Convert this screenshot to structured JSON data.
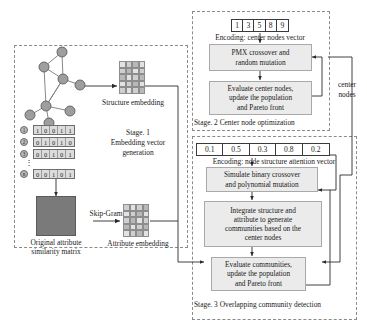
{
  "stage1": {
    "caption": "Stage. 1",
    "caption_line2": "Embedding vector",
    "caption_line3": "generation",
    "structure_embedding_label": "Structure embedding",
    "attribute_embedding_label": "Attribute embedding",
    "similarity_matrix_label_line1": "Original attribute",
    "similarity_matrix_label_line2": "similarity matrix",
    "skipgram_label": "Skip-Gram",
    "attribute_rows": [
      {
        "id": "1",
        "bits": [
          "1",
          "0",
          "0",
          "1",
          "1"
        ]
      },
      {
        "id": "2",
        "bits": [
          "0",
          "1",
          "0",
          "1",
          "0"
        ]
      },
      {
        "id": "3",
        "bits": [
          "0",
          "0",
          "1",
          "0",
          "1"
        ]
      },
      {
        "id": "n",
        "bits": [
          "0",
          "0",
          "1",
          "0",
          "1"
        ]
      }
    ],
    "ellipsis": "⋮"
  },
  "stage2": {
    "encoding_vector": [
      "1",
      "3",
      "5",
      "8",
      "9"
    ],
    "encoding_label": "Encoding: center nodes vector",
    "box1_line1": "PMX crossover and",
    "box1_line2": "random mutation",
    "box2_line1": "Evaluate center nodes,",
    "box2_line2": "update the population",
    "box2_line3": "and Pareto front",
    "caption": "Stage. 2 Center node optimization"
  },
  "stage3": {
    "encoding_vector": [
      "0.1",
      "0.5",
      "0.3",
      "0.8",
      "0.2"
    ],
    "encoding_label": "Encoding: node structure attention vector",
    "box1_line1": "Simulate binary crossover",
    "box1_line2": "and polynomial mutation",
    "box2_line1": "Integrate structure and",
    "box2_line2": "attribute to generate",
    "box2_line3": "communities based on the",
    "box2_line4": "center nodes",
    "box3_line1": "Evaluate communities,",
    "box3_line2": "update the population",
    "box3_line3": "and Pareto front",
    "caption": "Stage. 3 Overlapping community detection"
  },
  "connectors": {
    "center_nodes_line1": "center",
    "center_nodes_line2": "nodes"
  },
  "colors": {
    "box_fill": "#ebebeb",
    "box_border": "#a9a9a9",
    "panel_border": "#8a8a8a",
    "line": "#333333",
    "node_fill": "#9e9e9e",
    "matrix_fill": "#7a7a7a"
  }
}
